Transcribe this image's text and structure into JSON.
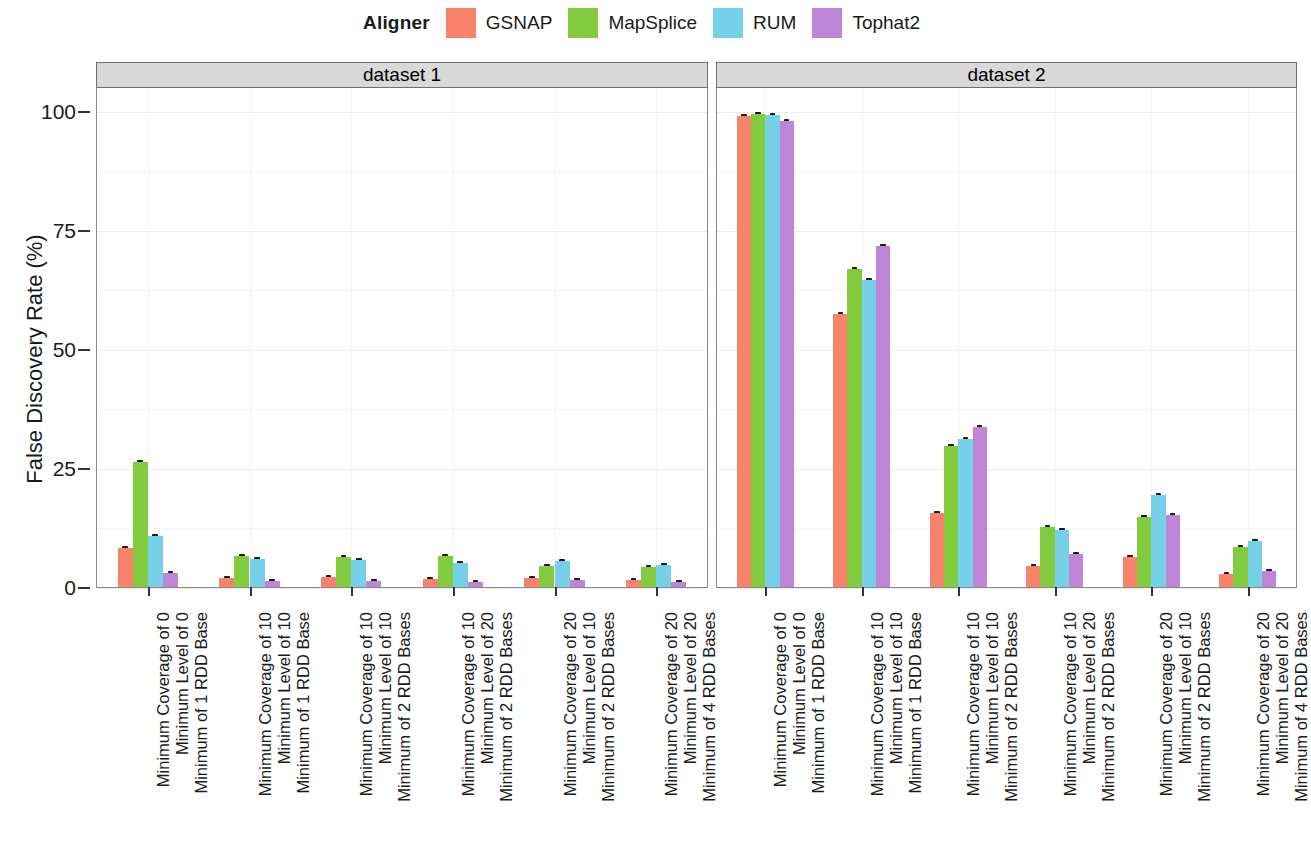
{
  "legend": {
    "title": "Aligner",
    "entries": [
      {
        "label": "GSNAP",
        "color": "#F8836A"
      },
      {
        "label": "MapSplice",
        "color": "#82CB3F"
      },
      {
        "label": "RUM",
        "color": "#76D1E8"
      },
      {
        "label": "Tophat2",
        "color": "#BE84D6"
      }
    ]
  },
  "axis": {
    "ylabel": "False Discovery Rate (%)",
    "yticks": [
      "0",
      "25",
      "50",
      "75",
      "100"
    ]
  },
  "panels": [
    {
      "strip": "dataset 1"
    },
    {
      "strip": "dataset 2"
    }
  ],
  "chart_data": {
    "type": "bar",
    "title": "",
    "xlabel": "",
    "ylabel": "False Discovery Rate (%)",
    "ylim": [
      0,
      105
    ],
    "ytick_values": [
      0,
      25,
      50,
      75,
      100
    ],
    "grid": true,
    "legend_position": "top",
    "legend_title": "Aligner",
    "series_names": [
      "GSNAP",
      "MapSplice",
      "RUM",
      "Tophat2"
    ],
    "series_colors": [
      "#F8836A",
      "#82CB3F",
      "#76D1E8",
      "#BE84D6"
    ],
    "facets": [
      "dataset 1",
      "dataset 2"
    ],
    "categories": [
      "Minimum Coverage of 0\nMinimum Level of 0\nMinimum of 1 RDD Base",
      "Minimum Coverage of 10\nMinimum Level of 10\nMinimum of 1 RDD Base",
      "Minimum Coverage of 10\nMinimum Level of 10\nMinimum of 2 RDD Bases",
      "Minimum Coverage of 10\nMinimum Level of 20\nMinimum of 2 RDD Bases",
      "Minimum Coverage of 20\nMinimum Level of 10\nMinimum of 2 RDD Bases",
      "Minimum Coverage of 20\nMinimum Level of 20\nMinimum of 4 RDD Bases"
    ],
    "category_lines": [
      [
        "Minimum Coverage of 0",
        "Minimum Level of 0",
        "Minimum of 1 RDD Base"
      ],
      [
        "Minimum Coverage of 10",
        "Minimum Level of 10",
        "Minimum of 1 RDD Base"
      ],
      [
        "Minimum Coverage of 10",
        "Minimum Level of 10",
        "Minimum of 2 RDD Bases"
      ],
      [
        "Minimum Coverage of 10",
        "Minimum Level of 20",
        "Minimum of 2 RDD Bases"
      ],
      [
        "Minimum Coverage of 20",
        "Minimum Level of 10",
        "Minimum of 2 RDD Bases"
      ],
      [
        "Minimum Coverage of 20",
        "Minimum Level of 20",
        "Minimum of 4 RDD Bases"
      ]
    ],
    "data": {
      "dataset 1": {
        "GSNAP": [
          8.2,
          1.8,
          2.0,
          1.7,
          1.8,
          1.5
        ],
        "MapSplice": [
          26.2,
          6.6,
          6.4,
          6.6,
          4.4,
          4.3
        ],
        "RUM": [
          10.7,
          5.9,
          5.7,
          5.0,
          5.4,
          4.7
        ],
        "Tophat2": [
          3.0,
          1.3,
          1.3,
          1.0,
          1.4,
          1.1
        ]
      },
      "dataset 2": {
        "GSNAP": [
          98.9,
          57.4,
          15.6,
          4.4,
          6.2,
          2.8
        ],
        "MapSplice": [
          99.3,
          66.7,
          29.6,
          12.5,
          14.8,
          8.3
        ],
        "RUM": [
          99.2,
          64.4,
          31.0,
          11.9,
          19.4,
          9.6
        ],
        "Tophat2": [
          97.9,
          71.7,
          33.6,
          7.0,
          15.1,
          3.4
        ]
      }
    },
    "error_bars": {
      "dataset 1": {
        "GSNAP": [
          0.4,
          0.2,
          0.2,
          0.2,
          0.2,
          0.2
        ],
        "MapSplice": [
          0.5,
          0.3,
          0.3,
          0.3,
          0.3,
          0.3
        ],
        "RUM": [
          0.4,
          0.3,
          0.3,
          0.3,
          0.3,
          0.3
        ],
        "Tophat2": [
          0.3,
          0.2,
          0.2,
          0.2,
          0.2,
          0.2
        ]
      },
      "dataset 2": {
        "GSNAP": [
          0.3,
          0.5,
          0.4,
          0.3,
          0.3,
          0.2
        ],
        "MapSplice": [
          0.3,
          0.5,
          0.5,
          0.4,
          0.4,
          0.3
        ],
        "RUM": [
          0.3,
          0.5,
          0.5,
          0.4,
          0.4,
          0.3
        ],
        "Tophat2": [
          0.3,
          0.5,
          0.5,
          0.3,
          0.4,
          0.2
        ]
      }
    }
  }
}
